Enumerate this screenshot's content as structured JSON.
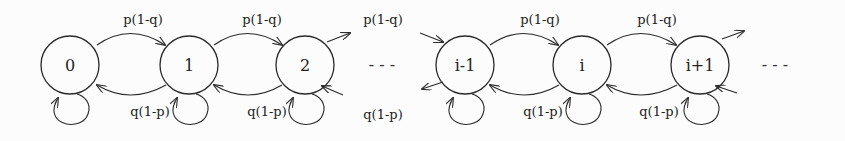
{
  "diagram": {
    "type": "markov-chain",
    "states": [
      "0",
      "1",
      "2",
      "i-1",
      "i",
      "i+1"
    ],
    "forward_label": "p(1-q)",
    "backward_label": "q(1-p)",
    "ellipsis": "-   -   -",
    "edges": [
      {
        "from": "0",
        "to": "1",
        "label": "p(1-q)"
      },
      {
        "from": "1",
        "to": "0",
        "label": "q(1-p)"
      },
      {
        "from": "1",
        "to": "2",
        "label": "p(1-q)"
      },
      {
        "from": "2",
        "to": "1",
        "label": "q(1-p)"
      },
      {
        "from": "2",
        "to": "…",
        "label": "p(1-q)"
      },
      {
        "from": "…",
        "to": "2",
        "label": "q(1-p)"
      },
      {
        "from": "i-1",
        "to": "i",
        "label": "p(1-q)"
      },
      {
        "from": "i",
        "to": "i-1",
        "label": "q(1-p)"
      },
      {
        "from": "i",
        "to": "i+1",
        "label": "p(1-q)"
      },
      {
        "from": "i+1",
        "to": "i",
        "label": "q(1-p)"
      }
    ],
    "self_loops": [
      "0",
      "1",
      "2",
      "i-1",
      "i",
      "i+1"
    ]
  }
}
